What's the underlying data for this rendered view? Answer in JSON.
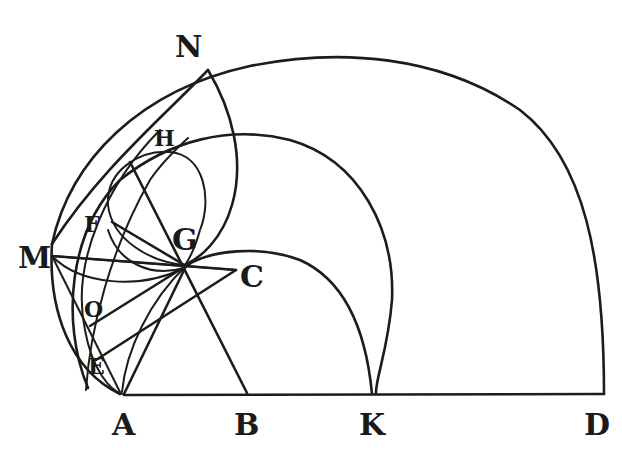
{
  "figure": {
    "type": "geometric-diagram",
    "colors": {
      "ink": "#1c1c1c",
      "background": "#ffffff"
    }
  },
  "labels": {
    "N": "N",
    "H": "H",
    "F": "F",
    "G": "G",
    "M": "M",
    "C": "C",
    "O": "O",
    "E": "E",
    "A": "A",
    "B": "B",
    "K": "K",
    "D": "D"
  },
  "baseline_points": [
    "A",
    "B",
    "K",
    "D"
  ]
}
